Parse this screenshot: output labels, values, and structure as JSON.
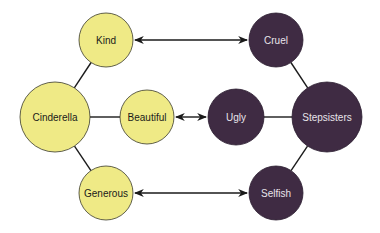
{
  "diagram": {
    "type": "concept-map",
    "colors": {
      "positive_fill": "#EFEA86",
      "positive_stroke": "#3a3a2a",
      "positive_text": "#1a1a1a",
      "negative_fill": "#3F2B43",
      "negative_stroke": "#2a1c2e",
      "negative_text": "#e8e4ea",
      "line": "#1a1a1a"
    },
    "nodes": [
      {
        "id": "kind",
        "label": "Kind",
        "group": "positive",
        "cx": 106,
        "cy": 40,
        "r": 27
      },
      {
        "id": "cinderella",
        "label": "Cinderella",
        "group": "positive",
        "cx": 55,
        "cy": 117,
        "r": 35
      },
      {
        "id": "beautiful",
        "label": "Beautiful",
        "group": "positive",
        "cx": 147,
        "cy": 117,
        "r": 27
      },
      {
        "id": "generous",
        "label": "Generous",
        "group": "positive",
        "cx": 106,
        "cy": 193,
        "r": 27
      },
      {
        "id": "cruel",
        "label": "Cruel",
        "group": "negative",
        "cx": 276,
        "cy": 40,
        "r": 27
      },
      {
        "id": "ugly",
        "label": "Ugly",
        "group": "negative",
        "cx": 236,
        "cy": 117,
        "r": 28
      },
      {
        "id": "stepsisters",
        "label": "Stepsisters",
        "group": "negative",
        "cx": 327,
        "cy": 117,
        "r": 35
      },
      {
        "id": "selfish",
        "label": "Selfish",
        "group": "negative",
        "cx": 276,
        "cy": 193,
        "r": 27
      }
    ],
    "links": [
      {
        "from": "cinderella",
        "to": "kind",
        "type": "line"
      },
      {
        "from": "cinderella",
        "to": "beautiful",
        "type": "line"
      },
      {
        "from": "cinderella",
        "to": "generous",
        "type": "line"
      },
      {
        "from": "stepsisters",
        "to": "cruel",
        "type": "line"
      },
      {
        "from": "stepsisters",
        "to": "ugly",
        "type": "line"
      },
      {
        "from": "stepsisters",
        "to": "selfish",
        "type": "line"
      },
      {
        "from": "kind",
        "to": "cruel",
        "type": "double-arrow"
      },
      {
        "from": "beautiful",
        "to": "ugly",
        "type": "double-arrow"
      },
      {
        "from": "generous",
        "to": "selfish",
        "type": "double-arrow"
      }
    ]
  }
}
